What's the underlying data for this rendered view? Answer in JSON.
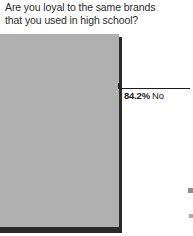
{
  "chart_data": {
    "type": "bar",
    "title": "Are you loyal to the same brands that you used in high school?",
    "title_lines": [
      "Are you loyal to the same brands",
      "that you used in high school?"
    ],
    "categories": [
      "No"
    ],
    "values": [
      84.2
    ],
    "value_unit": "%",
    "data_labels": [
      "84.2%"
    ],
    "xlabel": "",
    "ylabel": "",
    "ylim": [
      0,
      100
    ],
    "grid": false,
    "legend": false,
    "orientation": "vertical",
    "bar_color": "#b0b0b0",
    "shadow_color": "#2a2a2a",
    "background_color": "#ffffff",
    "title_color": "#2b2b2b",
    "label_color": "#1a1a1a",
    "note": "cropped view of a larger survey figure; only the 'No' bar and its callout are visible"
  },
  "callout": {
    "percent": "84.2%",
    "category": "No"
  }
}
